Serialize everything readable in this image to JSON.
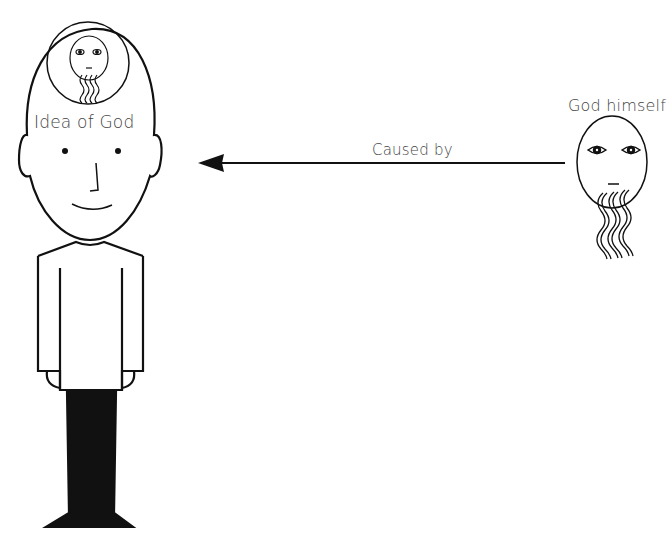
{
  "diagram": {
    "person": {
      "thought_label": "Idea of God"
    },
    "arrow": {
      "label": "Caused by",
      "direction": "right-to-left"
    },
    "god": {
      "label": "God himself"
    },
    "colors": {
      "stroke": "#111111",
      "text": "#444444",
      "background": "#ffffff"
    }
  }
}
